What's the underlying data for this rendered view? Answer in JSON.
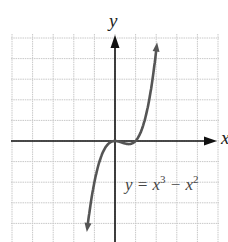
{
  "chart_data": {
    "type": "line",
    "title": "",
    "xlabel": "x",
    "ylabel": "y",
    "equation_label": "y = x³ − x²",
    "function": "x^3 - x^2",
    "series": [
      {
        "name": "y = x^3 - x^2",
        "x": [
          -1.35,
          -1.0,
          -0.75,
          -0.5,
          -0.25,
          0,
          0.25,
          0.5,
          0.667,
          0.85,
          1.0,
          1.25,
          1.5,
          1.75,
          2.05
        ],
        "y": [
          -4.28,
          -2.0,
          -0.98,
          -0.375,
          -0.078,
          0,
          -0.047,
          -0.125,
          -0.148,
          -0.108,
          0,
          0.391,
          1.125,
          2.297,
          4.41
        ]
      }
    ],
    "xlim": [
      -5,
      5
    ],
    "ylim": [
      -4.6,
      5.3
    ],
    "grid": true,
    "grid_step": 1,
    "axis_arrows": true,
    "curve_color": "#555555",
    "axis_color": "#111111",
    "grid_color": "#c8c8c8"
  },
  "labels": {
    "y_axis": "y",
    "x_axis": "x",
    "equation_lhs": "y = x",
    "equation_exp1": "3",
    "equation_mid": " − x",
    "equation_exp2": "2"
  }
}
